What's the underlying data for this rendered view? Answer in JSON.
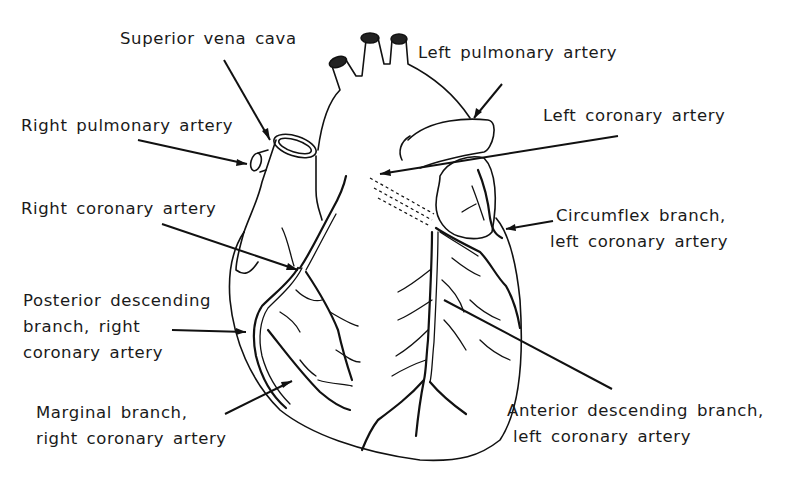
{
  "figure": {
    "line_color": "#111111",
    "background": "#ffffff"
  },
  "labels": [
    {
      "id": "superior-vena-cava",
      "lines": [
        "Superior vena cava"
      ]
    },
    {
      "id": "left-pulmonary-artery",
      "lines": [
        "Left pulmonary artery"
      ]
    },
    {
      "id": "right-pulmonary-artery",
      "lines": [
        "Right pulmonary artery"
      ]
    },
    {
      "id": "left-coronary-artery",
      "lines": [
        "Left coronary artery"
      ]
    },
    {
      "id": "right-coronary-artery",
      "lines": [
        "Right coronary artery"
      ]
    },
    {
      "id": "circumflex-branch",
      "lines": [
        "Circumflex branch,",
        "left coronary artery"
      ]
    },
    {
      "id": "posterior-descending-branch",
      "lines": [
        "Posterior descending",
        "branch, right",
        "coronary artery"
      ]
    },
    {
      "id": "marginal-branch",
      "lines": [
        "Marginal branch,",
        "right coronary artery"
      ]
    },
    {
      "id": "anterior-descending-branch",
      "lines": [
        "Anterior descending branch,",
        "left coronary artery"
      ]
    }
  ]
}
